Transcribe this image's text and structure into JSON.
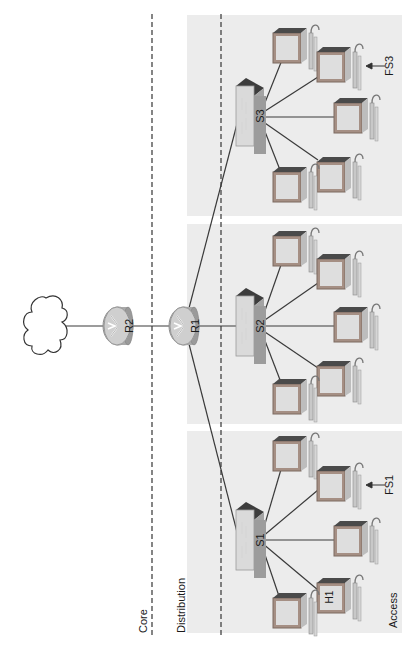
{
  "diagram": {
    "type": "hierarchical-network-topology",
    "orientation": "rotated-90-ccw",
    "layers": [
      {
        "id": "core",
        "label": "Core"
      },
      {
        "id": "distribution",
        "label": "Distribution"
      },
      {
        "id": "access",
        "label": "Access"
      }
    ],
    "nodes": {
      "cloud": {
        "label": ""
      },
      "r2": {
        "label": "R2",
        "type": "router"
      },
      "r1": {
        "label": "R1",
        "type": "router"
      },
      "s1": {
        "label": "S1",
        "type": "switch"
      },
      "s2": {
        "label": "S2",
        "type": "switch"
      },
      "s3": {
        "label": "S3",
        "type": "switch"
      }
    },
    "hosts": {
      "h1": {
        "label": "H1"
      },
      "fs1": {
        "label": "FS1"
      },
      "fs3": {
        "label": "FS3"
      }
    },
    "links": [
      [
        "cloud",
        "r2"
      ],
      [
        "r2",
        "r1"
      ],
      [
        "r1",
        "s1"
      ],
      [
        "r1",
        "s2"
      ],
      [
        "r1",
        "s3"
      ],
      [
        "s1",
        "pc x5"
      ],
      [
        "s2",
        "pc x5"
      ],
      [
        "s3",
        "pc x5"
      ]
    ],
    "colors": {
      "panel": "#ededed",
      "line": "#3a3a3a",
      "router": "#b8b8b8",
      "switch": "#9a9a9a",
      "pc_frame": "#a08a80",
      "pc_screen": "#dcdcdc"
    }
  }
}
